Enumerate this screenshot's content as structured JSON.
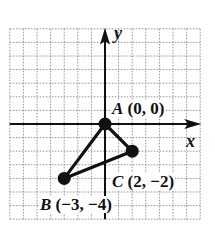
{
  "diagram": {
    "type": "coordinate-plane",
    "grid": {
      "x_min": -7,
      "x_max": 7,
      "y_min": -7,
      "y_max": 7,
      "unit_px": 13.6
    },
    "axes": {
      "x_label": "x",
      "y_label": "y"
    },
    "points": [
      {
        "name": "A",
        "coords": "(0, 0)",
        "x": 0,
        "y": 0
      },
      {
        "name": "B",
        "coords": "(−3, −4)",
        "x": -3,
        "y": -4
      },
      {
        "name": "C",
        "coords": "(2, −2)",
        "x": 2,
        "y": -2
      }
    ],
    "shape": "triangle ABC",
    "colors": {
      "ink": "#111111",
      "grid": "#8a8a8a",
      "background": "#ffffff"
    }
  }
}
